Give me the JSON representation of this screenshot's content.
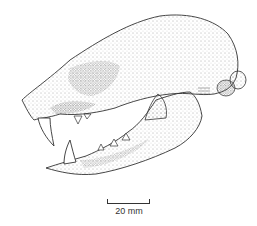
{
  "figure": {
    "style": "stippled-line-drawing",
    "ink_color": "#333333",
    "background": "#ffffff"
  },
  "scale_bar": {
    "label": "20 mm"
  }
}
